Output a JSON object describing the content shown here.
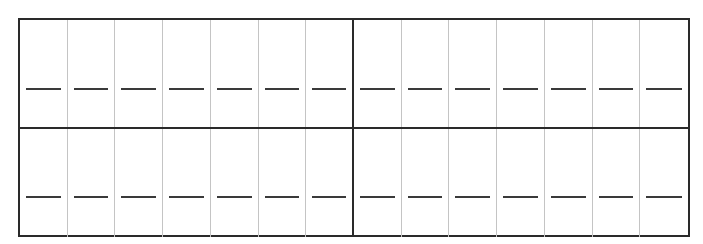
{
  "worksheet": {
    "rows": 2,
    "groups_per_row": 2,
    "boxes_per_group": 7,
    "colors": {
      "border": "#2a2a2a",
      "divider": "#c4c4c4",
      "blank": "#3a3a3a"
    },
    "blanks": [
      [
        "",
        "",
        "",
        "",
        "",
        "",
        "",
        "",
        "",
        "",
        "",
        "",
        "",
        ""
      ],
      [
        "",
        "",
        "",
        "",
        "",
        "",
        "",
        "",
        "",
        "",
        "",
        "",
        "",
        ""
      ]
    ]
  }
}
